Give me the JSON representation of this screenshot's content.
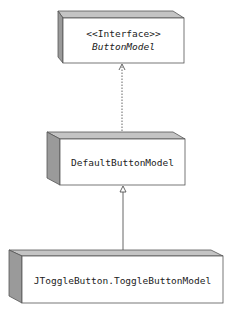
{
  "diagram": {
    "type": "uml-class-hierarchy",
    "colors": {
      "front_face": "#ffffff",
      "top_face": "#c4c4c4",
      "side_face": "#9a9a9a",
      "outline": "#555555",
      "line": "#555555"
    },
    "nodes": [
      {
        "id": "button-model",
        "stereotype": "<<Interface>>",
        "name": "ButtonModel",
        "italic": true
      },
      {
        "id": "default-button-model",
        "stereotype": "",
        "name": "DefaultButtonModel",
        "italic": false
      },
      {
        "id": "toggle-button-model",
        "stereotype": "",
        "name": "JToggleButton.ToggleButtonModel",
        "italic": false
      }
    ],
    "edges": [
      {
        "from": "default-button-model",
        "to": "button-model",
        "kind": "realization",
        "style": "dashed",
        "arrowhead": "open-triangle"
      },
      {
        "from": "toggle-button-model",
        "to": "default-button-model",
        "kind": "generalization",
        "style": "solid",
        "arrowhead": "hollow-triangle"
      }
    ]
  }
}
